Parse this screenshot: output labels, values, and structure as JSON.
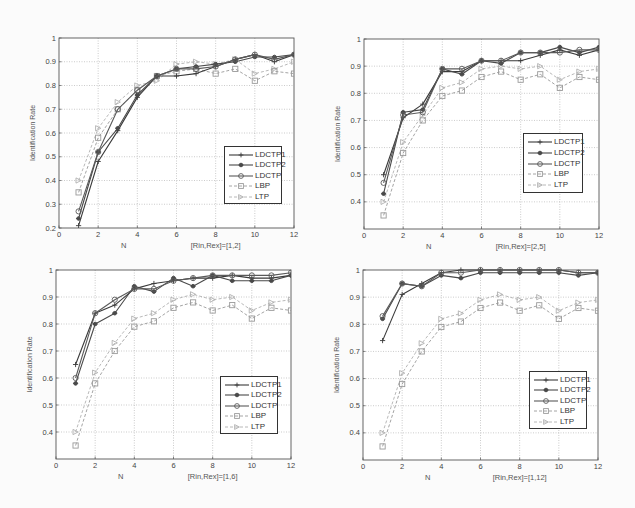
{
  "figure": {
    "series_meta": [
      {
        "name": "LDCTP1",
        "color": "#3a3a3a",
        "dash": "",
        "marker": "plus",
        "width": 1.1
      },
      {
        "name": "LDCTP2",
        "color": "#4a4a4a",
        "dash": "",
        "marker": "star",
        "width": 1.1
      },
      {
        "name": "LDCTP",
        "color": "#5a5a5a",
        "dash": "",
        "marker": "circle",
        "width": 1.1
      },
      {
        "name": "LBP",
        "color": "#9a9a9a",
        "dash": "3,2",
        "marker": "square",
        "width": 0.9
      },
      {
        "name": "LTP",
        "color": "#b0b0b0",
        "dash": "3,2",
        "marker": "triangle",
        "width": 0.9
      }
    ]
  },
  "chart_data": [
    {
      "type": "line",
      "title": "",
      "xlabel": "N",
      "subtitle": "[Rin,Rex]=[1,2]",
      "ylabel": "Identification Rate",
      "xlim": [
        0,
        12
      ],
      "ylim": [
        0.2,
        1.0
      ],
      "xticks": [
        0,
        2,
        4,
        6,
        8,
        10,
        12
      ],
      "yticks": [
        0.2,
        0.3,
        0.4,
        0.5,
        0.6,
        0.7,
        0.8,
        0.9,
        1.0
      ],
      "ytick_labels": [
        "0.2",
        "0.3",
        "0.4",
        "0.5",
        "0.6",
        "0.7",
        "0.8",
        "0.9",
        "1"
      ],
      "grid": true,
      "legend_position": "lower right",
      "x": [
        1,
        2,
        3,
        4,
        5,
        6,
        7,
        8,
        9,
        10,
        11,
        12
      ],
      "series": [
        {
          "name": "LDCTP1",
          "values": [
            0.21,
            0.48,
            0.61,
            0.75,
            0.84,
            0.84,
            0.85,
            0.88,
            0.91,
            0.93,
            0.9,
            0.93
          ]
        },
        {
          "name": "LDCTP2",
          "values": [
            0.24,
            0.52,
            0.62,
            0.76,
            0.84,
            0.87,
            0.88,
            0.89,
            0.9,
            0.92,
            0.92,
            0.93
          ]
        },
        {
          "name": "LDCTP",
          "values": [
            0.27,
            0.52,
            0.7,
            0.78,
            0.84,
            0.87,
            0.87,
            0.88,
            0.91,
            0.93,
            0.91,
            0.93
          ]
        },
        {
          "name": "LBP",
          "values": [
            0.35,
            0.58,
            0.7,
            0.78,
            0.84,
            0.86,
            0.87,
            0.85,
            0.87,
            0.82,
            0.86,
            0.85
          ]
        },
        {
          "name": "LTP",
          "values": [
            0.4,
            0.62,
            0.73,
            0.8,
            0.82,
            0.89,
            0.9,
            0.89,
            0.91,
            0.85,
            0.87,
            0.9
          ]
        }
      ]
    },
    {
      "type": "line",
      "title": "",
      "xlabel": "N",
      "subtitle": "[Rin,Rex]=[2,5]",
      "ylabel": "Identification Rate",
      "xlim": [
        0,
        12
      ],
      "ylim": [
        0.3,
        1.0
      ],
      "xticks": [
        0,
        2,
        4,
        6,
        8,
        10,
        12
      ],
      "yticks": [
        0.4,
        0.5,
        0.6,
        0.7,
        0.8,
        0.9,
        1.0
      ],
      "ytick_labels": [
        "0.4",
        "0.5",
        "0.6",
        "0.7",
        "0.8",
        "0.9",
        "1"
      ],
      "grid": true,
      "legend_position": "lower right",
      "x": [
        1,
        2,
        3,
        4,
        5,
        6,
        7,
        8,
        9,
        10,
        11,
        12
      ],
      "series": [
        {
          "name": "LDCTP1",
          "values": [
            0.5,
            0.71,
            0.76,
            0.88,
            0.88,
            0.92,
            0.92,
            0.92,
            0.94,
            0.96,
            0.94,
            0.96
          ]
        },
        {
          "name": "LDCTP2",
          "values": [
            0.43,
            0.73,
            0.74,
            0.89,
            0.87,
            0.92,
            0.91,
            0.95,
            0.95,
            0.97,
            0.95,
            0.97
          ]
        },
        {
          "name": "LDCTP",
          "values": [
            0.47,
            0.72,
            0.73,
            0.89,
            0.89,
            0.92,
            0.92,
            0.95,
            0.95,
            0.95,
            0.96,
            0.96
          ]
        },
        {
          "name": "LBP",
          "values": [
            0.35,
            0.58,
            0.7,
            0.79,
            0.81,
            0.86,
            0.88,
            0.85,
            0.87,
            0.82,
            0.86,
            0.85
          ]
        },
        {
          "name": "LTP",
          "values": [
            0.4,
            0.62,
            0.72,
            0.82,
            0.84,
            0.89,
            0.9,
            0.89,
            0.9,
            0.85,
            0.88,
            0.89
          ]
        }
      ]
    },
    {
      "type": "line",
      "title": "",
      "xlabel": "N",
      "subtitle": "[Rin,Rex]=[1,6]",
      "ylabel": "Identification Rate",
      "xlim": [
        0,
        12
      ],
      "ylim": [
        0.3,
        1.0
      ],
      "xticks": [
        0,
        2,
        4,
        6,
        8,
        10,
        12
      ],
      "yticks": [
        0.4,
        0.5,
        0.6,
        0.7,
        0.8,
        0.9,
        1.0
      ],
      "ytick_labels": [
        "0.4",
        "0.5",
        "0.6",
        "0.7",
        "0.8",
        "0.9",
        "1"
      ],
      "grid": true,
      "legend_position": "lower right",
      "x": [
        1,
        2,
        3,
        4,
        5,
        6,
        7,
        8,
        9,
        10,
        11,
        12
      ],
      "series": [
        {
          "name": "LDCTP1",
          "values": [
            0.65,
            0.84,
            0.87,
            0.93,
            0.95,
            0.96,
            0.97,
            0.97,
            0.98,
            0.97,
            0.97,
            0.98
          ]
        },
        {
          "name": "LDCTP2",
          "values": [
            0.58,
            0.8,
            0.84,
            0.94,
            0.92,
            0.97,
            0.94,
            0.98,
            0.96,
            0.96,
            0.96,
            0.98
          ]
        },
        {
          "name": "LDCTP",
          "values": [
            0.6,
            0.84,
            0.89,
            0.93,
            0.93,
            0.96,
            0.97,
            0.98,
            0.98,
            0.98,
            0.98,
            0.99
          ]
        },
        {
          "name": "LBP",
          "values": [
            0.35,
            0.58,
            0.7,
            0.79,
            0.81,
            0.86,
            0.88,
            0.85,
            0.87,
            0.82,
            0.86,
            0.85
          ]
        },
        {
          "name": "LTP",
          "values": [
            0.4,
            0.62,
            0.73,
            0.82,
            0.84,
            0.89,
            0.91,
            0.89,
            0.9,
            0.85,
            0.88,
            0.89
          ]
        }
      ]
    },
    {
      "type": "line",
      "title": "",
      "xlabel": "N",
      "subtitle": "[Rin,Rex]=[1,12]",
      "ylabel": "Identification Rate",
      "xlim": [
        0,
        12
      ],
      "ylim": [
        0.3,
        1.0
      ],
      "xticks": [
        0,
        2,
        4,
        6,
        8,
        10,
        12
      ],
      "yticks": [
        0.4,
        0.5,
        0.6,
        0.7,
        0.8,
        0.9,
        1.0
      ],
      "ytick_labels": [
        "0.4",
        "0.5",
        "0.6",
        "0.7",
        "0.8",
        "0.9",
        "1"
      ],
      "grid": true,
      "legend_position": "lower right",
      "x": [
        1,
        2,
        3,
        4,
        5,
        6,
        7,
        8,
        9,
        10,
        11,
        12
      ],
      "series": [
        {
          "name": "LDCTP1",
          "values": [
            0.74,
            0.91,
            0.95,
            0.99,
            1.0,
            1.0,
            1.0,
            1.0,
            1.0,
            1.0,
            0.99,
            0.99
          ]
        },
        {
          "name": "LDCTP2",
          "values": [
            0.82,
            0.95,
            0.94,
            0.98,
            0.97,
            0.99,
            0.99,
            0.99,
            0.99,
            0.99,
            0.98,
            0.99
          ]
        },
        {
          "name": "LDCTP",
          "values": [
            0.83,
            0.95,
            0.94,
            0.99,
            0.99,
            1.0,
            1.0,
            1.0,
            1.0,
            1.0,
            0.99,
            0.99
          ]
        },
        {
          "name": "LBP",
          "values": [
            0.35,
            0.58,
            0.7,
            0.79,
            0.81,
            0.86,
            0.88,
            0.85,
            0.87,
            0.82,
            0.86,
            0.85
          ]
        },
        {
          "name": "LTP",
          "values": [
            0.4,
            0.62,
            0.73,
            0.82,
            0.84,
            0.89,
            0.91,
            0.89,
            0.9,
            0.85,
            0.88,
            0.89
          ]
        }
      ]
    }
  ],
  "layout": {
    "panels": [
      {
        "left": 0,
        "top": 0,
        "ax": {
          "x0": 59,
          "x1": 294,
          "y0": 38,
          "y1": 228
        }
      },
      {
        "left": 317,
        "top": 0,
        "ax": {
          "x0": 47,
          "x1": 282,
          "y0": 39,
          "y1": 229
        }
      },
      {
        "left": 0,
        "top": 254,
        "ax": {
          "x0": 56,
          "x1": 291,
          "y0": 16,
          "y1": 205
        }
      },
      {
        "left": 317,
        "top": 254,
        "ax": {
          "x0": 46,
          "x1": 281,
          "y0": 16,
          "y1": 206
        }
      }
    ],
    "legends": [
      {
        "x": 224,
        "y": 146,
        "w": 56,
        "h": 56
      },
      {
        "x": 206,
        "y": 133,
        "w": 58,
        "h": 58
      },
      {
        "x": 220,
        "y": 122,
        "w": 56,
        "h": 56
      },
      {
        "x": 212,
        "y": 117,
        "w": 56,
        "h": 56
      }
    ]
  }
}
